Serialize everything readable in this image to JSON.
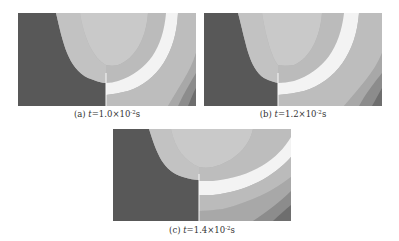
{
  "figure": {
    "panels": [
      {
        "id": "a",
        "label": "(a)",
        "var": "t",
        "eq": "=1.0×10",
        "exp": "-2",
        "unit": "s",
        "crack_x": 0.47
      },
      {
        "id": "b",
        "label": "(b)",
        "var": "t",
        "eq": "=1.2×10",
        "exp": "-2",
        "unit": "s",
        "crack_x": 0.4
      },
      {
        "id": "c",
        "label": "(c)",
        "var": "t",
        "eq": "=1.4×10",
        "exp": "-2",
        "unit": "s",
        "crack_x": 0.48
      }
    ],
    "colors": {
      "dark": "#585858",
      "light1": "#bdbdbd",
      "light2": "#c9c9c9",
      "light3": "#b3b3b3",
      "white_band": "#f3f3f3",
      "mid1": "#a8a8a8",
      "mid2": "#8c8c8c",
      "mid3": "#6e6e6e"
    }
  }
}
